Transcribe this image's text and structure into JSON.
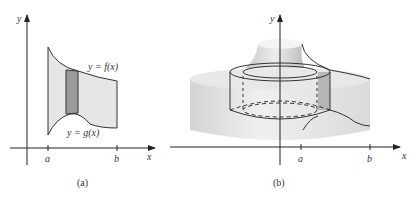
{
  "panel_a": {
    "caption": "(a)",
    "x_axis_label": "x",
    "y_axis_label": "y",
    "tick_a": "a",
    "tick_b": "b",
    "upper_curve_label": "y = f(x)",
    "lower_curve_label": "y = g(x)"
  },
  "panel_b": {
    "caption": "(b)",
    "x_axis_label": "x",
    "y_axis_label": "y",
    "tick_a": "a",
    "tick_b": "b"
  },
  "colors": {
    "region_fill": "#e6e6e6",
    "strip_fill": "#9a9a9a",
    "line": "#333333",
    "solid_fill": "#d9d9d9"
  }
}
